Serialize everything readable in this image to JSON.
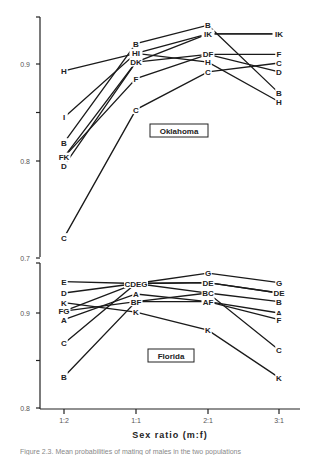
{
  "chart_data": [
    {
      "type": "line",
      "title": "Oklahoma",
      "xlabel": "Sex ratio (m:f)",
      "ylabel": "",
      "categories": [
        "1:2",
        "1:1",
        "2:1",
        "3:1"
      ],
      "ylim": [
        0.7,
        0.95
      ],
      "yticks": [
        {
          "v": 0.9,
          "label": "0.9"
        },
        {
          "v": 0.85,
          "label": ""
        },
        {
          "v": 0.8,
          "label": "0.8"
        },
        {
          "v": 0.7,
          "label": "0.7"
        }
      ],
      "series": [
        {
          "name": "B",
          "values": [
            0.819,
            0.921,
            0.94,
            0.87
          ]
        },
        {
          "name": "C",
          "values": [
            0.721,
            0.853,
            0.892,
            0.901
          ]
        },
        {
          "name": "D",
          "values": [
            0.795,
            0.902,
            0.91,
            0.892
          ]
        },
        {
          "name": "F",
          "values": [
            0.804,
            0.885,
            0.91,
            0.91
          ]
        },
        {
          "name": "H",
          "values": [
            0.893,
            0.911,
            0.902,
            0.861
          ]
        },
        {
          "name": "I",
          "values": [
            0.845,
            0.911,
            0.931,
            0.931
          ]
        },
        {
          "name": "K",
          "values": [
            0.804,
            0.902,
            0.931,
            0.931
          ]
        }
      ],
      "point_labels": [
        [
          "H",
          "I",
          "B",
          "F K",
          "D",
          "C"
        ],
        [
          "B",
          "H I",
          "D K",
          "F",
          "C"
        ],
        [
          "B",
          "I K",
          "D F",
          "H",
          "C"
        ],
        [
          "I K",
          "F",
          "C",
          "D",
          "B",
          "H"
        ]
      ]
    },
    {
      "type": "line",
      "title": "Florida",
      "xlabel": "Sex ratio (m:f)",
      "ylabel": "",
      "categories": [
        "1:2",
        "1:1",
        "2:1",
        "3:1"
      ],
      "ylim": [
        0.8,
        0.952
      ],
      "yticks": [
        {
          "v": 0.9,
          "label": "0.9"
        },
        {
          "v": 0.85,
          "label": ""
        },
        {
          "v": 0.8,
          "label": "0.8"
        }
      ],
      "series": [
        {
          "name": "A",
          "values": [
            0.893,
            0.92,
            0.912,
            0.9
          ]
        },
        {
          "name": "B",
          "values": [
            0.833,
            0.912,
            0.921,
            0.912
          ]
        },
        {
          "name": "C",
          "values": [
            0.868,
            0.931,
            0.921,
            0.861
          ]
        },
        {
          "name": "D",
          "values": [
            0.921,
            0.931,
            0.932,
            0.921
          ]
        },
        {
          "name": "E",
          "values": [
            0.933,
            0.931,
            0.932,
            0.921
          ]
        },
        {
          "name": "F",
          "values": [
            0.902,
            0.912,
            0.912,
            0.893
          ]
        },
        {
          "name": "G",
          "values": [
            0.902,
            0.931,
            0.942,
            0.932
          ]
        },
        {
          "name": "K",
          "values": [
            0.911,
            0.901,
            0.882,
            0.832
          ]
        }
      ],
      "point_labels": [
        [
          "E",
          "D",
          "K",
          "FG",
          "A",
          "C",
          "B"
        ],
        [
          "C DEG",
          "A",
          "B F",
          "K"
        ],
        [
          "G",
          "D E",
          "BC",
          "A F",
          "K"
        ],
        [
          "G",
          "DE",
          "B",
          "A",
          "F",
          "C",
          "K"
        ]
      ]
    }
  ],
  "figure": {
    "xlabel": "Sex ratio (m:f)",
    "x_tick_labels": [
      "1:2",
      "1:1",
      "2:1",
      "3:1"
    ],
    "panel_labels": [
      "Oklahoma",
      "Florida"
    ],
    "caption": "Figure 2.3. Mean probabilities of mating of males in the two populations"
  }
}
